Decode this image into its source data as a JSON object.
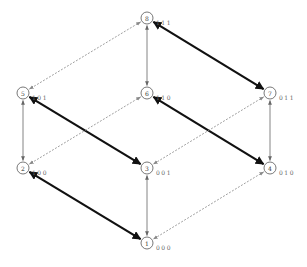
{
  "diagram": {
    "type": "cube-lattice",
    "nodes": [
      {
        "id": "1",
        "binary": "000",
        "x": 147,
        "y": 243
      },
      {
        "id": "2",
        "binary": "100",
        "x": 23,
        "y": 168
      },
      {
        "id": "3",
        "binary": "001",
        "x": 147,
        "y": 168
      },
      {
        "id": "4",
        "binary": "010",
        "x": 270,
        "y": 168
      },
      {
        "id": "5",
        "binary": "101",
        "x": 23,
        "y": 93
      },
      {
        "id": "6",
        "binary": "110",
        "x": 147,
        "y": 93
      },
      {
        "id": "7",
        "binary": "011",
        "x": 270,
        "y": 93
      },
      {
        "id": "8",
        "binary": "111",
        "x": 147,
        "y": 18
      }
    ],
    "edges": [
      {
        "from": "8",
        "to": "5",
        "style": "dashed"
      },
      {
        "from": "8",
        "to": "6",
        "style": "thin"
      },
      {
        "from": "8",
        "to": "7",
        "style": "thick"
      },
      {
        "from": "5",
        "to": "2",
        "style": "thin"
      },
      {
        "from": "5",
        "to": "3",
        "style": "thick"
      },
      {
        "from": "6",
        "to": "2",
        "style": "dashed"
      },
      {
        "from": "6",
        "to": "4",
        "style": "thick"
      },
      {
        "from": "7",
        "to": "3",
        "style": "dashed"
      },
      {
        "from": "7",
        "to": "4",
        "style": "thin"
      },
      {
        "from": "2",
        "to": "1",
        "style": "thick"
      },
      {
        "from": "3",
        "to": "1",
        "style": "thin"
      },
      {
        "from": "4",
        "to": "1",
        "style": "dashed"
      }
    ],
    "colors": {
      "thick": "#111111",
      "thin": "#666666",
      "dashed": "#888888",
      "node": "#555555"
    }
  }
}
